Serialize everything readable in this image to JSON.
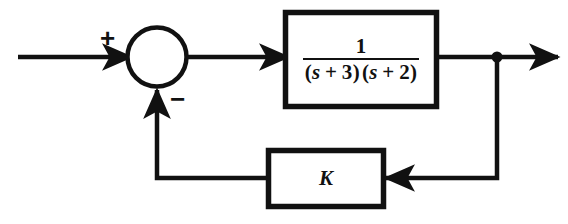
{
  "diagram": {
    "type": "control-system-block-diagram",
    "line_color": "#111111",
    "background_color": "#ffffff",
    "summing_junction": {
      "name": "summing-junction",
      "positive_sign": "+",
      "negative_sign": "−",
      "positive_input": "reference-input",
      "negative_input": "feedback-signal"
    },
    "plant_block": {
      "name": "plant-transfer-function",
      "numerator": "1",
      "denominator_factor_1_open": "(",
      "denominator_variable_1": "s",
      "denominator_operator_1": "+",
      "denominator_constant_1": "3",
      "denominator_factor_1_close": ")",
      "denominator_factor_2_open": "(",
      "denominator_variable_2": "s",
      "denominator_operator_2": "+",
      "denominator_constant_2": "2",
      "denominator_factor_2_close": ")"
    },
    "gain_block": {
      "name": "feedback-gain",
      "label": "K"
    },
    "signals": {
      "input_arrow": "input-signal-arrow",
      "error_arrow": "error-signal-arrow",
      "output_arrow": "output-signal-arrow",
      "feedback_arrow": "feedback-signal-arrow",
      "takeoff_point": "output-takeoff-node"
    }
  }
}
